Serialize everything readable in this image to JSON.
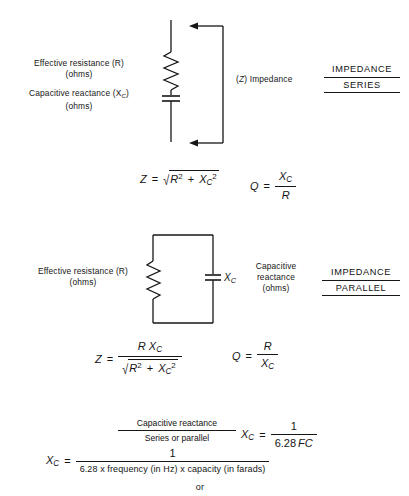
{
  "page": {
    "width": 409,
    "height": 496,
    "background": "#ffffff",
    "ink": "#161616"
  },
  "series_section": {
    "heading_line1": "IMPEDANCE",
    "heading_line2": "SERIES",
    "resistor_label_line1": "Effective  resistance (R)",
    "resistor_label_line2": "(ohms)",
    "capacitor_label_line1": "Capacitive  reactance (X",
    "capacitor_label_sub": "C",
    "capacitor_label_close": ")",
    "capacitor_label_line2": "(ohms)",
    "impedance_label_open": "(",
    "impedance_label_symbol": "Z",
    "impedance_label_close": ")  Impedance",
    "components": [
      "resistor-zigzag",
      "capacitor-plates"
    ],
    "arrow_direction": "left"
  },
  "series_formulas": {
    "z_lhs": "Z",
    "z_eq": "=",
    "z_radicand_r": "R",
    "z_radicand_r_exp": "2",
    "z_plus": "+",
    "z_radicand_x": "X",
    "z_radicand_x_sub": "C",
    "z_radicand_x_exp": "2",
    "q_lhs": "Q",
    "q_eq": "=",
    "q_num_x": "X",
    "q_num_sub": "C",
    "q_den": "R"
  },
  "parallel_section": {
    "heading_line1": "IMPEDANCE",
    "heading_line2": "PARALLEL",
    "resistor_label_line1": "Effective   resistance (R)",
    "resistor_label_line2": "(ohms)",
    "capacitor_symbol": "X",
    "capacitor_symbol_sub": "C",
    "capacitor_label_line1": "Capacitive",
    "capacitor_label_line2": "reactance",
    "capacitor_label_line3": "(ohms)",
    "components": [
      "resistor-zigzag",
      "capacitor-plates"
    ]
  },
  "parallel_formulas": {
    "z_lhs": "Z",
    "z_eq": "=",
    "z_num_r": "R",
    "z_num_x": "X",
    "z_num_x_sub": "C",
    "z_den_r": "R",
    "z_den_r_exp": "2",
    "z_den_plus": "+",
    "z_den_x": "X",
    "z_den_x_sub": "C",
    "z_den_x_exp": "2",
    "q_lhs": "Q",
    "q_eq": "=",
    "q_num": "R",
    "q_den_x": "X",
    "q_den_sub": "C"
  },
  "reactance_block": {
    "title_line1": "Capacitive  reactance",
    "title_line2": "Series or parallel",
    "short_lhs_x": "X",
    "short_lhs_sub": "C",
    "short_eq": "=",
    "short_num": "1",
    "short_den_number": "6.28",
    "short_den_symbols": "FC",
    "long_lhs_x": "X",
    "long_lhs_sub": "C",
    "long_eq": "=",
    "long_num": "1",
    "long_den": "6.28 x frequency (in Hz) x capacity (in farads)",
    "footer": "or"
  }
}
